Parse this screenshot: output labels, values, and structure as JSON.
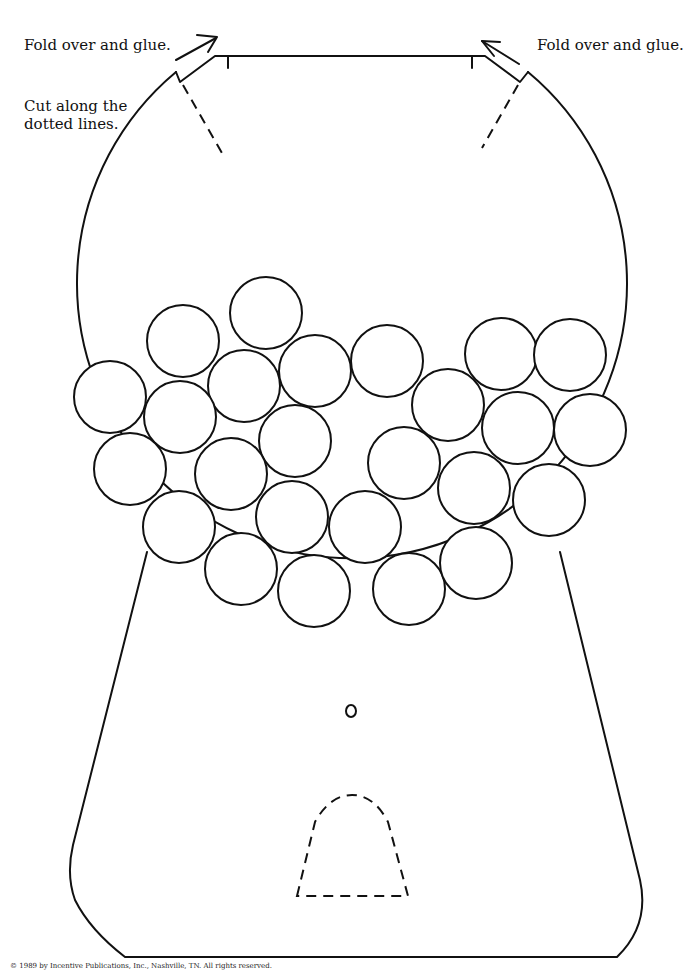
{
  "labels": {
    "fold_left": "Fold over and glue.",
    "fold_right": "Fold over and glue.",
    "cut_instruction": "Cut along the dotted lines.",
    "copyright": "© 1989 by Incentive Publications, Inc., Nashville, TN. All rights reserved."
  },
  "figure": {
    "gumball_count": 25,
    "colors": {
      "line": "#111111",
      "background": "#ffffff"
    }
  }
}
